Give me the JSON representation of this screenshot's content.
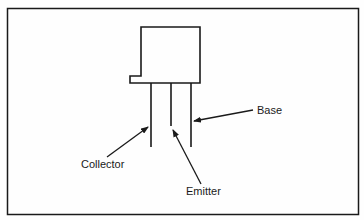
{
  "diagram": {
    "labels": {
      "base": "Base",
      "collector": "Collector",
      "emitter": "Emitter"
    },
    "colors": {
      "stroke": "#1a1a1a",
      "background": "#fefefe"
    },
    "components": {
      "body": "transistor-body",
      "leads": [
        "collector-lead",
        "emitter-lead",
        "base-lead"
      ]
    }
  }
}
